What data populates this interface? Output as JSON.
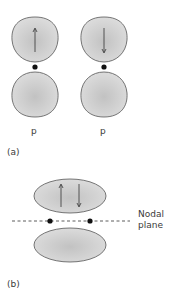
{
  "diagram": {
    "panel_a": {
      "label": "(a)",
      "orbitals": [
        {
          "label": "p",
          "spin": "up"
        },
        {
          "label": "p",
          "spin": "down"
        }
      ]
    },
    "panel_b": {
      "label": "(b)",
      "spins": [
        "up",
        "down"
      ],
      "nodal_plane_label_line1": "Nodal",
      "nodal_plane_label_line2": "plane"
    },
    "colors": {
      "lobe_fill_center": "#c4c4c4",
      "lobe_fill_edge": "#dcdcdc",
      "lobe_stroke": "#555555",
      "nucleus": "#111111",
      "dashed_line": "#333333"
    }
  }
}
